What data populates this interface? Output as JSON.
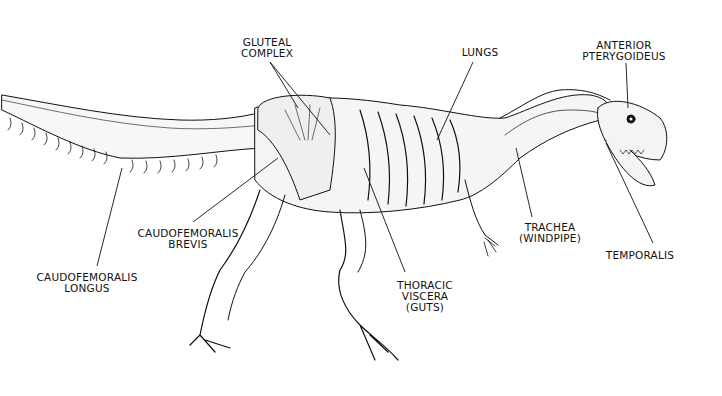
{
  "diagram": {
    "background": "#ffffff",
    "ink": "#111111",
    "labels": [
      {
        "id": "gluteal-complex",
        "lines": [
          "GLUTEAL",
          "COMPLEX"
        ],
        "x": 267,
        "y": 37,
        "leader": [
          [
            270,
            62
          ],
          [
            298,
            108
          ],
          [
            270,
            62
          ],
          [
            330,
            135
          ]
        ]
      },
      {
        "id": "lungs",
        "lines": [
          "LUNGS"
        ],
        "x": 480,
        "y": 47,
        "leader": [
          [
            473,
            62
          ],
          [
            437,
            140
          ]
        ]
      },
      {
        "id": "anterior-pterygoideus",
        "lines": [
          "ANTERIOR",
          "PTERYGOIDEUS"
        ],
        "x": 624,
        "y": 40,
        "leader": [
          [
            626,
            63
          ],
          [
            628,
            108
          ]
        ]
      },
      {
        "id": "caudofemoralis-brevis",
        "lines": [
          "CAUDOFEMORALIS",
          "BREVIS"
        ],
        "x": 188,
        "y": 228,
        "leader": [
          [
            193,
            222
          ],
          [
            278,
            158
          ]
        ]
      },
      {
        "id": "caudofemoralis-longus",
        "lines": [
          "CAUDOFEMORALIS",
          "LONGUS"
        ],
        "x": 87,
        "y": 272,
        "leader": [
          [
            97,
            266
          ],
          [
            122,
            168
          ]
        ]
      },
      {
        "id": "thoracic-viscera",
        "lines": [
          "THORACIC",
          "VISCERA",
          "(GUTS)"
        ],
        "x": 425,
        "y": 280,
        "leader": [
          [
            405,
            272
          ],
          [
            364,
            168
          ]
        ]
      },
      {
        "id": "trachea",
        "lines": [
          "TRACHEA",
          "(WINDPIPE)"
        ],
        "x": 550,
        "y": 222,
        "leader": [
          [
            532,
            217
          ],
          [
            516,
            148
          ]
        ]
      },
      {
        "id": "temporalis",
        "lines": [
          "TEMPORALIS"
        ],
        "x": 640,
        "y": 250,
        "leader": [
          [
            653,
            243
          ],
          [
            606,
            143
          ]
        ]
      }
    ]
  }
}
